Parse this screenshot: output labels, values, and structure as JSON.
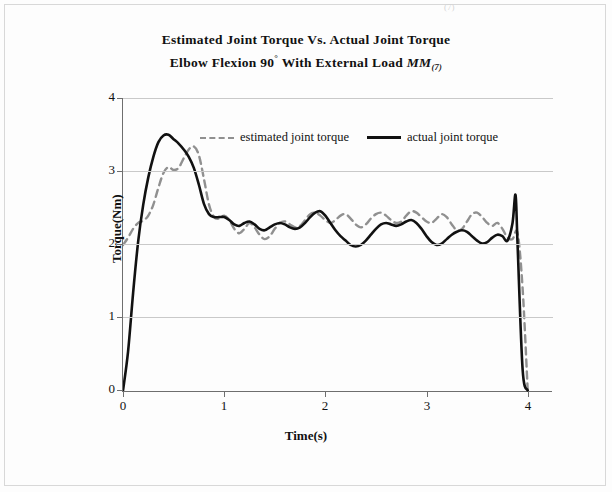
{
  "page": {
    "faint_mark": "(7)"
  },
  "title": {
    "line1": "Estimated  Joint Torque  Vs. Actual Joint Torque",
    "line2_pre": "Elbow Flexion 90",
    "line2_sup": "°",
    "line2_mid": " With External Load ",
    "line2_ital": "MM",
    "line2_sub": "(7)"
  },
  "legend": {
    "items": [
      {
        "label": "estimated joint torque",
        "style": "dashed",
        "color": "#909090"
      },
      {
        "label": "actual joint torque",
        "style": "solid",
        "color": "#111111"
      }
    ]
  },
  "axes": {
    "ylabel": "Torque(Nm)",
    "xlabel": "Time(s)",
    "yticks": [
      "0",
      "1",
      "2",
      "3",
      "4"
    ],
    "xticks": [
      "0",
      "1",
      "2",
      "3",
      "4"
    ]
  },
  "chart_data": {
    "type": "line",
    "xlabel": "Time(s)",
    "ylabel": "Torque(Nm)",
    "xlim": [
      0,
      4.25
    ],
    "ylim": [
      0,
      4
    ],
    "grid": "horizontal",
    "legend_position": "upper-center",
    "series": [
      {
        "name": "estimated joint torque",
        "color": "#909090",
        "linestyle": "dashed",
        "x": [
          0.0,
          0.05,
          0.1,
          0.15,
          0.2,
          0.25,
          0.3,
          0.35,
          0.4,
          0.45,
          0.5,
          0.55,
          0.6,
          0.65,
          0.7,
          0.75,
          0.8,
          0.85,
          0.9,
          0.95,
          1.0,
          1.05,
          1.1,
          1.15,
          1.2,
          1.25,
          1.3,
          1.35,
          1.4,
          1.45,
          1.5,
          1.55,
          1.6,
          1.65,
          1.7,
          1.75,
          1.8,
          1.85,
          1.9,
          1.95,
          2.0,
          2.05,
          2.1,
          2.15,
          2.2,
          2.25,
          2.3,
          2.35,
          2.4,
          2.45,
          2.5,
          2.55,
          2.6,
          2.65,
          2.7,
          2.75,
          2.8,
          2.85,
          2.9,
          2.95,
          3.0,
          3.05,
          3.1,
          3.15,
          3.2,
          3.25,
          3.3,
          3.35,
          3.4,
          3.45,
          3.5,
          3.55,
          3.6,
          3.65,
          3.7,
          3.75,
          3.8,
          3.85,
          3.9,
          3.95,
          4.0
        ],
        "y": [
          2.0,
          2.1,
          2.22,
          2.3,
          2.33,
          2.4,
          2.55,
          2.78,
          2.98,
          3.06,
          3.02,
          3.05,
          3.18,
          3.3,
          3.34,
          3.22,
          2.9,
          2.55,
          2.38,
          2.36,
          2.4,
          2.34,
          2.22,
          2.16,
          2.22,
          2.3,
          2.24,
          2.14,
          2.08,
          2.12,
          2.22,
          2.3,
          2.32,
          2.28,
          2.24,
          2.26,
          2.34,
          2.42,
          2.44,
          2.4,
          2.34,
          2.3,
          2.34,
          2.4,
          2.42,
          2.36,
          2.28,
          2.24,
          2.28,
          2.36,
          2.42,
          2.44,
          2.4,
          2.34,
          2.3,
          2.32,
          2.4,
          2.46,
          2.44,
          2.38,
          2.32,
          2.3,
          2.36,
          2.42,
          2.38,
          2.28,
          2.2,
          2.22,
          2.32,
          2.42,
          2.44,
          2.38,
          2.3,
          2.26,
          2.3,
          2.22,
          2.1,
          2.08,
          2.16,
          1.4,
          0.02
        ]
      },
      {
        "name": "actual joint torque",
        "color": "#111111",
        "linestyle": "solid",
        "x": [
          0.0,
          0.05,
          0.1,
          0.15,
          0.2,
          0.25,
          0.3,
          0.35,
          0.4,
          0.45,
          0.5,
          0.55,
          0.6,
          0.65,
          0.7,
          0.75,
          0.8,
          0.85,
          0.9,
          0.95,
          1.0,
          1.05,
          1.1,
          1.15,
          1.2,
          1.25,
          1.3,
          1.35,
          1.4,
          1.45,
          1.5,
          1.55,
          1.6,
          1.65,
          1.7,
          1.75,
          1.8,
          1.85,
          1.9,
          1.95,
          2.0,
          2.05,
          2.1,
          2.15,
          2.2,
          2.25,
          2.3,
          2.35,
          2.4,
          2.45,
          2.5,
          2.55,
          2.6,
          2.65,
          2.7,
          2.75,
          2.8,
          2.85,
          2.9,
          2.95,
          3.0,
          3.05,
          3.1,
          3.15,
          3.2,
          3.25,
          3.3,
          3.35,
          3.4,
          3.45,
          3.5,
          3.55,
          3.6,
          3.65,
          3.7,
          3.75,
          3.8,
          3.85,
          3.88,
          3.9,
          3.95,
          4.0
        ],
        "y": [
          0.02,
          0.55,
          1.35,
          2.05,
          2.55,
          2.92,
          3.2,
          3.4,
          3.49,
          3.5,
          3.44,
          3.38,
          3.3,
          3.2,
          3.05,
          2.82,
          2.56,
          2.42,
          2.38,
          2.38,
          2.38,
          2.34,
          2.28,
          2.26,
          2.3,
          2.32,
          2.28,
          2.22,
          2.2,
          2.24,
          2.28,
          2.3,
          2.28,
          2.24,
          2.22,
          2.24,
          2.3,
          2.38,
          2.44,
          2.46,
          2.4,
          2.3,
          2.2,
          2.12,
          2.06,
          2.0,
          1.98,
          2.0,
          2.06,
          2.14,
          2.22,
          2.28,
          2.3,
          2.28,
          2.26,
          2.28,
          2.32,
          2.34,
          2.3,
          2.22,
          2.12,
          2.04,
          2.0,
          2.02,
          2.08,
          2.14,
          2.18,
          2.2,
          2.18,
          2.12,
          2.06,
          2.02,
          2.04,
          2.1,
          2.14,
          2.12,
          2.06,
          2.3,
          2.68,
          2.0,
          0.3,
          0.02
        ]
      }
    ]
  }
}
